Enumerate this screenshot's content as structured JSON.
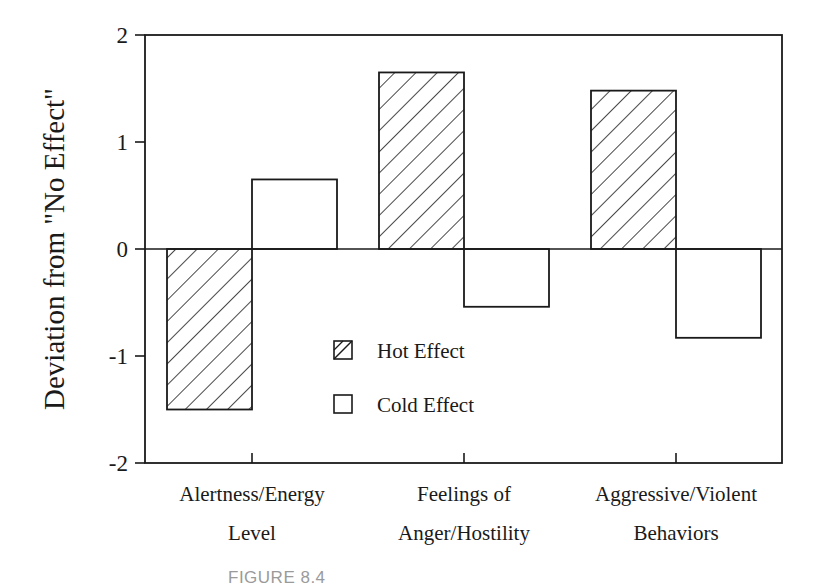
{
  "chart_data": {
    "type": "bar",
    "title": "",
    "xlabel": "",
    "ylabel": "Deviation from \"No Effect\"",
    "ylim": [
      -2,
      2
    ],
    "yticks": [
      2,
      1,
      0,
      -1,
      -2
    ],
    "grid": false,
    "legend_position": "inside-center-bottom",
    "categories": [
      "Alertness/Energy Level",
      "Feelings of Anger/Hostility",
      "Aggressive/Violent Behaviors"
    ],
    "category_lines": [
      [
        "Alertness/Energy",
        "Level"
      ],
      [
        "Feelings of",
        "Anger/Hostility"
      ],
      [
        "Aggressive/Violent",
        "Behaviors"
      ]
    ],
    "series": [
      {
        "name": "Hot Effect",
        "pattern": "diagonal-hatch",
        "values": [
          -1.5,
          1.65,
          1.48
        ]
      },
      {
        "name": "Cold Effect",
        "pattern": "solid-white",
        "values": [
          0.65,
          -0.54,
          -0.83
        ]
      }
    ]
  },
  "axis": {
    "ylabel": "Deviation from \"No Effect\"",
    "ytick_labels": [
      "2",
      "1",
      "0",
      "-1",
      "-2"
    ]
  },
  "legend": {
    "items": [
      {
        "label": "Hot Effect",
        "swatch": "hatched"
      },
      {
        "label": "Cold Effect",
        "swatch": "empty"
      }
    ]
  },
  "caption": {
    "text": "FIGURE 8.4"
  },
  "colors": {
    "ink": "#1a1a1a",
    "background": "#ffffff",
    "caption": "#9a9a9a"
  }
}
